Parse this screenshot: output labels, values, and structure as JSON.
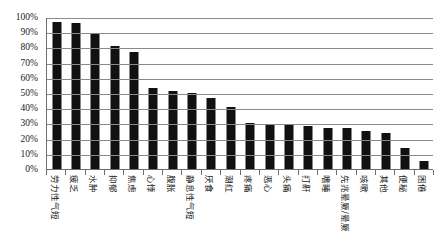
{
  "chart_data": {
    "type": "bar",
    "title": "",
    "subtitle": "",
    "xlabel": "",
    "ylabel": "",
    "ylim": [
      0,
      100
    ],
    "grid": true,
    "legend": null,
    "value_suffix": "%",
    "orientation": "vertical",
    "bar_color": "#111111",
    "categories": [
      "劳力性气短",
      "疲乏",
      "水肿",
      "抑郁",
      "焦虑",
      "心悸",
      "腹胀",
      "静息性气短",
      "厌食",
      "潮红",
      "疼痛",
      "恶心",
      "头痛",
      "打鼾",
      "嗜睡",
      "先兆晕厥/晕厥",
      "咳嗽",
      "其他",
      "便秘",
      "困倦"
    ],
    "values": [
      97,
      96,
      89,
      81,
      77,
      53,
      51,
      50,
      47,
      41,
      30,
      29,
      29,
      28,
      27,
      27,
      25,
      24,
      14,
      5
    ],
    "yticks": [
      0,
      10,
      20,
      30,
      40,
      50,
      60,
      70,
      80,
      90,
      100
    ],
    "ytick_labels": [
      "0%",
      "10%",
      "20%",
      "30%",
      "40%",
      "50%",
      "60%",
      "70%",
      "80%",
      "90%",
      "100%"
    ]
  }
}
